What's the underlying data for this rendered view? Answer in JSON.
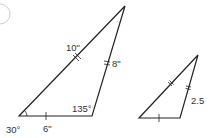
{
  "problem_marker": "",
  "large_triangle": {
    "side_long_label": "10\"",
    "side_right_label": "8\"",
    "side_bottom_label": "6\"",
    "angle_bottom_left_label": "30°",
    "angle_bottom_right_label": "135°"
  },
  "small_triangle": {
    "side_right_label": "2.5"
  },
  "colors": {
    "stroke": "#222222",
    "text": "#333333"
  }
}
